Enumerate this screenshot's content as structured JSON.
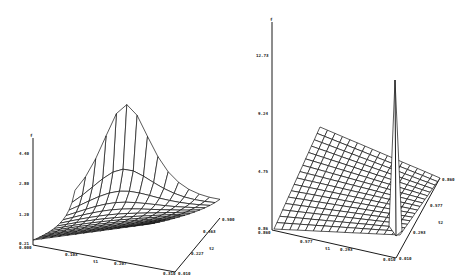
{
  "chart_data": [
    {
      "type": "surface3d",
      "title": "",
      "xlabel": "t1",
      "ylabel": "t2",
      "zlabel": "f",
      "z_ticks": [
        "0.21",
        "1.20",
        "2.80",
        "4.40"
      ],
      "x_ticks": [
        "0.000",
        "0.103",
        "0.207",
        "0.310"
      ],
      "y_ticks": [
        "0.010",
        "0.227",
        "0.463",
        "0.500"
      ],
      "description": "Wireframe surface rising sharply to a peak (~5.5) at the back-left corner (low t1, high t2) and decaying toward ~0.2 elsewhere",
      "peak_value": 5.5,
      "grid": false
    },
    {
      "type": "surface3d",
      "title": "",
      "xlabel": "t1",
      "ylabel": "t2",
      "zlabel": "f",
      "z_ticks": [
        "0.86",
        "4.75",
        "9.24",
        "12.73"
      ],
      "x_ticks": [
        "0.860",
        "0.577",
        "0.293",
        "0.010"
      ],
      "y_ticks": [
        "0.010",
        "0.293",
        "0.577",
        "0.860"
      ],
      "description": "Near-planar wireframe surface (~1 to 4) with a sharp narrow spike (~10.5) near the front-right corner",
      "peak_value": 10.5,
      "grid": false
    }
  ],
  "left": {
    "z_label": "f",
    "z_ticks": [
      "4.40",
      "2.80",
      "1.20",
      "0.21"
    ],
    "origin_label": "0.000",
    "x_axis_name": "t1",
    "x_ticks": [
      "0.103",
      "0.207",
      "0.310"
    ],
    "y_axis_name": "t2",
    "y_ticks": [
      "0.010",
      "0.227",
      "0.463",
      "0.500"
    ]
  },
  "right": {
    "z_label": "f",
    "z_ticks": [
      "12.73",
      "9.24",
      "4.75",
      "0.86"
    ],
    "origin_label": "0.860",
    "x_axis_name": "t1",
    "x_ticks": [
      "0.577",
      "0.293",
      "0.010"
    ],
    "y_axis_name": "t2",
    "y_ticks": [
      "0.010",
      "0.293",
      "0.577",
      "0.860"
    ]
  }
}
